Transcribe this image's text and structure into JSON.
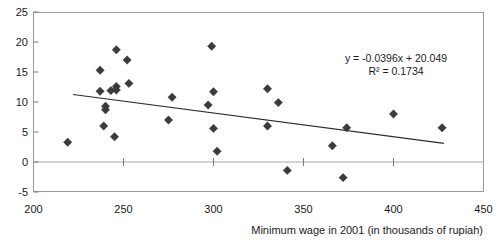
{
  "chart_data": {
    "type": "scatter",
    "title": "",
    "xlabel": "Minimum wage in 2001 (in thousands of rupiah)",
    "ylabel": "",
    "xlim": [
      200,
      450
    ],
    "ylim": [
      -5,
      25
    ],
    "xticks": [
      200,
      250,
      300,
      350,
      400,
      450
    ],
    "yticks": [
      -5,
      0,
      5,
      10,
      15,
      20,
      25
    ],
    "grid": false,
    "legend": false,
    "zero_line": true,
    "points": [
      {
        "x": 219,
        "y": 3.3
      },
      {
        "x": 237,
        "y": 15.3
      },
      {
        "x": 237,
        "y": 11.8
      },
      {
        "x": 239,
        "y": 6.0
      },
      {
        "x": 240,
        "y": 9.3
      },
      {
        "x": 240,
        "y": 8.7
      },
      {
        "x": 243,
        "y": 11.9
      },
      {
        "x": 246,
        "y": 12.6
      },
      {
        "x": 246,
        "y": 12.0
      },
      {
        "x": 246,
        "y": 18.7
      },
      {
        "x": 245,
        "y": 4.2
      },
      {
        "x": 252,
        "y": 17.0
      },
      {
        "x": 253,
        "y": 13.1
      },
      {
        "x": 275,
        "y": 7.0
      },
      {
        "x": 277,
        "y": 10.8
      },
      {
        "x": 299,
        "y": 19.3
      },
      {
        "x": 300,
        "y": 11.7
      },
      {
        "x": 297,
        "y": 9.5
      },
      {
        "x": 300,
        "y": 5.6
      },
      {
        "x": 302,
        "y": 1.8
      },
      {
        "x": 330,
        "y": 12.2
      },
      {
        "x": 330,
        "y": 6.0
      },
      {
        "x": 336,
        "y": 9.9
      },
      {
        "x": 341,
        "y": -1.4
      },
      {
        "x": 366,
        "y": 2.7
      },
      {
        "x": 372,
        "y": -2.6
      },
      {
        "x": 374,
        "y": 5.7
      },
      {
        "x": 400,
        "y": 8.0
      },
      {
        "x": 427,
        "y": 5.7
      }
    ],
    "trendline": {
      "slope": -0.0396,
      "intercept": 20.049,
      "x_start": 222,
      "x_end": 428,
      "equation": "y = -0.0396x + 20.049",
      "r_squared_label": "R² = 0.1734",
      "r_squared": 0.1734
    },
    "annotations": [
      {
        "name": "regression-equation",
        "text": "y = -0.0396x + 20.049"
      },
      {
        "name": "r-squared",
        "text": "R² = 0.1734"
      }
    ]
  },
  "axes": {
    "x_tick_labels": [
      "200",
      "250",
      "300",
      "350",
      "400",
      "450"
    ],
    "y_tick_labels": [
      "25",
      "20",
      "15",
      "10",
      "5",
      "0",
      "-5"
    ],
    "x_axis_title": "Minimum wage in 2001 (in thousands of rupiah)"
  },
  "colors": {
    "marker": "#3b3b3b",
    "trendline": "#2b2b2b",
    "frame": "#9a9a9a",
    "zero_line": "#a8a8a8",
    "text": "#1a1a1a",
    "background": "#ffffff"
  }
}
